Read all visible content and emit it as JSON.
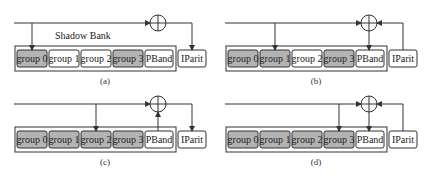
{
  "colors": {
    "line": "#333333",
    "shaded": "#b3b3b3",
    "plain": "#ffffff",
    "border": "#333333"
  },
  "labels": {
    "shadow_bank": "Shadow Bank",
    "groups": [
      "group 0",
      "group 1",
      "group 2",
      "group 3"
    ],
    "pband": "PBand",
    "iparit": "IParit"
  },
  "panels": [
    {
      "id": "a",
      "caption": "(a)",
      "shaded_groups": [
        0,
        3
      ],
      "drop_group": 0,
      "show_shadow_bank_label": true,
      "flow": "xor-to-iparit"
    },
    {
      "id": "b",
      "caption": "(b)",
      "shaded_groups": [
        0,
        1,
        3
      ],
      "drop_group": 1,
      "show_shadow_bank_label": false,
      "flow": "iparit-xor-to-pband"
    },
    {
      "id": "c",
      "caption": "(c)",
      "shaded_groups": [
        0,
        1,
        2,
        3
      ],
      "drop_group": 2,
      "show_shadow_bank_label": false,
      "flow": "pband-xor-to-iparit"
    },
    {
      "id": "d",
      "caption": "(d)",
      "shaded_groups": [
        0,
        1,
        2,
        3
      ],
      "drop_group": 3,
      "show_shadow_bank_label": false,
      "flow": "iparit-xor-to-pband"
    }
  ]
}
